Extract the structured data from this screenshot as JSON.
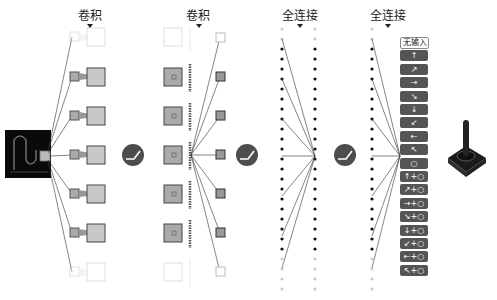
{
  "layers": {
    "conv1": {
      "label": "卷积"
    },
    "conv2": {
      "label": "卷积"
    },
    "fc1": {
      "label": "全连接"
    },
    "fc2": {
      "label": "全连接"
    }
  },
  "activation": {
    "icon": "relu-icon",
    "count": 3
  },
  "actions": [
    {
      "label": "无输入",
      "icon": "none"
    },
    {
      "label": "↑",
      "icon": "arrow-up"
    },
    {
      "label": "↗",
      "icon": "arrow-up-right"
    },
    {
      "label": "→",
      "icon": "arrow-right"
    },
    {
      "label": "↘",
      "icon": "arrow-down-right"
    },
    {
      "label": "↓",
      "icon": "arrow-down"
    },
    {
      "label": "↙",
      "icon": "arrow-down-left"
    },
    {
      "label": "←",
      "icon": "arrow-left"
    },
    {
      "label": "↖",
      "icon": "arrow-up-left"
    },
    {
      "label": "○",
      "icon": "fire"
    },
    {
      "label": "↑+○",
      "icon": "arrow-up-fire"
    },
    {
      "label": "↗+○",
      "icon": "arrow-up-right-fire"
    },
    {
      "label": "→+○",
      "icon": "arrow-right-fire"
    },
    {
      "label": "↘+○",
      "icon": "arrow-down-right-fire"
    },
    {
      "label": "↓+○",
      "icon": "arrow-down-fire"
    },
    {
      "label": "↙+○",
      "icon": "arrow-down-left-fire"
    },
    {
      "label": "←+○",
      "icon": "arrow-left-fire"
    },
    {
      "label": "↖+○",
      "icon": "arrow-up-left-fire"
    }
  ],
  "output_device": {
    "icon": "joystick-icon"
  },
  "colors": {
    "dark": "#4d4d4d",
    "feature": "#b0b0b0",
    "faded": "#dddddd",
    "input_bg": "#0a0a0a"
  }
}
